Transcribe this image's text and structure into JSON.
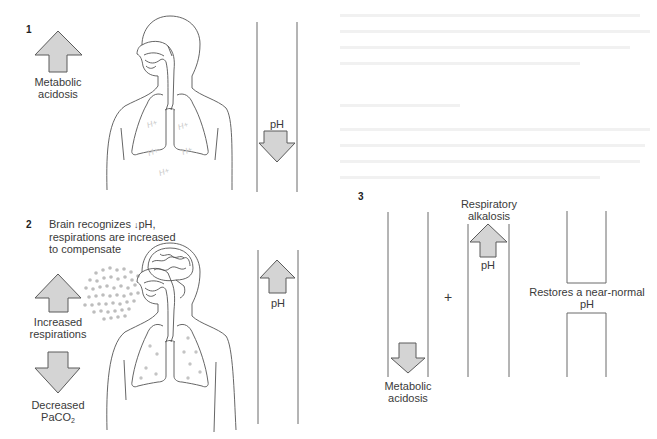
{
  "figure": {
    "colors": {
      "arrow_fill": "#d4d4d4",
      "arrow_stroke": "#5a5a5a",
      "line": "#6a6a6a",
      "body_outline": "#555555",
      "co2_dots": "#bdbdbd",
      "h_ions": "#c8c8c8"
    },
    "panel1": {
      "number": "1",
      "arrow_up_label_line1": "Metabolic",
      "arrow_up_label_line2": "acidosis",
      "ion_label": "H+",
      "ph_column": {
        "label": "pH",
        "arrow": "down"
      }
    },
    "panel2": {
      "number": "2",
      "caption_line1_prefix": "Brain recognizes ",
      "caption_line1_arrow": "↓",
      "caption_line1_suffix": "pH,",
      "caption_line2": "respirations are increased",
      "caption_line3": "to compensate",
      "up_arrow_label_line1": "Increased",
      "up_arrow_label_line2": "respirations",
      "down_arrow_label_line1": "Decreased",
      "down_arrow_label_line2_main": "PaCO",
      "down_arrow_label_line2_sub": "2",
      "ph_column": {
        "label": "pH",
        "arrow": "up"
      }
    },
    "panel3": {
      "number": "3",
      "left_column": {
        "arrow": "down",
        "label_line1": "Metabolic",
        "label_line2": "acidosis"
      },
      "operator": "+",
      "middle_column": {
        "arrow": "up",
        "label_line1": "Respiratory",
        "label_line2": "alkalosis",
        "arrow_label": "pH"
      },
      "right_column": {
        "label_line1": "Restores a near-normal",
        "label_line2": "pH"
      }
    }
  }
}
